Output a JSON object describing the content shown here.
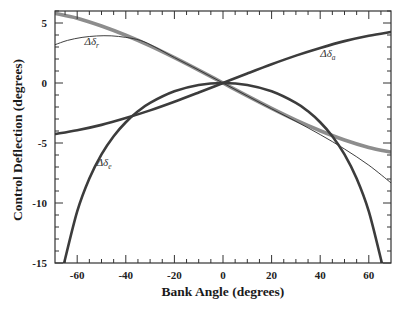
{
  "chart_data": {
    "type": "line",
    "title": "",
    "xlabel": "Bank Angle (degrees)",
    "ylabel": "Control Deflection (degrees)",
    "xlim": [
      -69,
      69
    ],
    "ylim": [
      -15,
      6
    ],
    "xticks": [
      -60,
      -40,
      -20,
      0,
      20,
      40,
      60
    ],
    "xtick_labels": [
      "-60",
      "-40",
      "-20",
      "0",
      "20",
      "40",
      "60"
    ],
    "yticks": [
      5,
      0,
      -5,
      -10,
      -15
    ],
    "ytick_labels": [
      "5",
      "0",
      "-5",
      "-10",
      "-15"
    ],
    "grid": false,
    "legend": "none (inline curve labels)",
    "series": [
      {
        "name": "Δδr (thick)",
        "style": "thick-gray",
        "color": "#8c8c8c",
        "x": [
          -69,
          -60,
          -50,
          -40,
          -30,
          -20,
          -10,
          0,
          10,
          20,
          30,
          40,
          50,
          60,
          69
        ],
        "y": [
          5.8,
          5.4,
          4.75,
          3.98,
          3.1,
          2.12,
          1.08,
          0,
          -1.08,
          -2.12,
          -3.1,
          -3.98,
          -4.75,
          -5.37,
          -5.75
        ]
      },
      {
        "name": "Δδr (thin)",
        "style": "thin-black",
        "color": "#222222",
        "x": [
          -69,
          -64,
          -58,
          -52,
          -46,
          -40,
          -34,
          -28,
          -20,
          -10,
          0,
          10,
          20,
          30,
          40,
          50,
          60,
          69
        ],
        "y": [
          3.2,
          3.55,
          3.8,
          3.92,
          3.93,
          3.8,
          3.55,
          3.0,
          2.12,
          1.08,
          0,
          -1.08,
          -2.15,
          -3.2,
          -4.3,
          -5.5,
          -6.85,
          -8.3
        ]
      },
      {
        "name": "Δδa",
        "style": "thick-dark",
        "color": "#3a3a3a",
        "x": [
          -69,
          -60,
          -50,
          -40,
          -30,
          -20,
          -10,
          0,
          10,
          20,
          30,
          40,
          50,
          60,
          69
        ],
        "y": [
          -4.25,
          -3.94,
          -3.49,
          -2.92,
          -2.28,
          -1.56,
          -0.79,
          0,
          0.79,
          1.56,
          2.28,
          2.92,
          3.49,
          3.94,
          4.25
        ]
      },
      {
        "name": "Δδe",
        "style": "thick-dark",
        "color": "#3a3a3a",
        "x": [
          -65.5,
          -60,
          -55,
          -50,
          -45,
          -40,
          -35,
          -30,
          -20,
          -10,
          0,
          10,
          20,
          30,
          35,
          40,
          45,
          50,
          55,
          60,
          65.5
        ],
        "y": [
          -15.1,
          -10.7,
          -7.96,
          -5.95,
          -4.43,
          -3.27,
          -2.36,
          -1.65,
          -0.69,
          -0.16,
          0,
          -0.16,
          -0.69,
          -1.65,
          -2.36,
          -3.27,
          -4.43,
          -5.95,
          -7.96,
          -10.7,
          -15.1
        ]
      }
    ],
    "annotations": [
      {
        "text": "Δδ",
        "sub": "r",
        "x": -57,
        "y": 3.2
      },
      {
        "text": "Δδ",
        "sub": "a",
        "x": 40,
        "y": 2.2
      },
      {
        "text": "Δδ",
        "sub": "e",
        "x": -52,
        "y": -6.9
      }
    ]
  }
}
